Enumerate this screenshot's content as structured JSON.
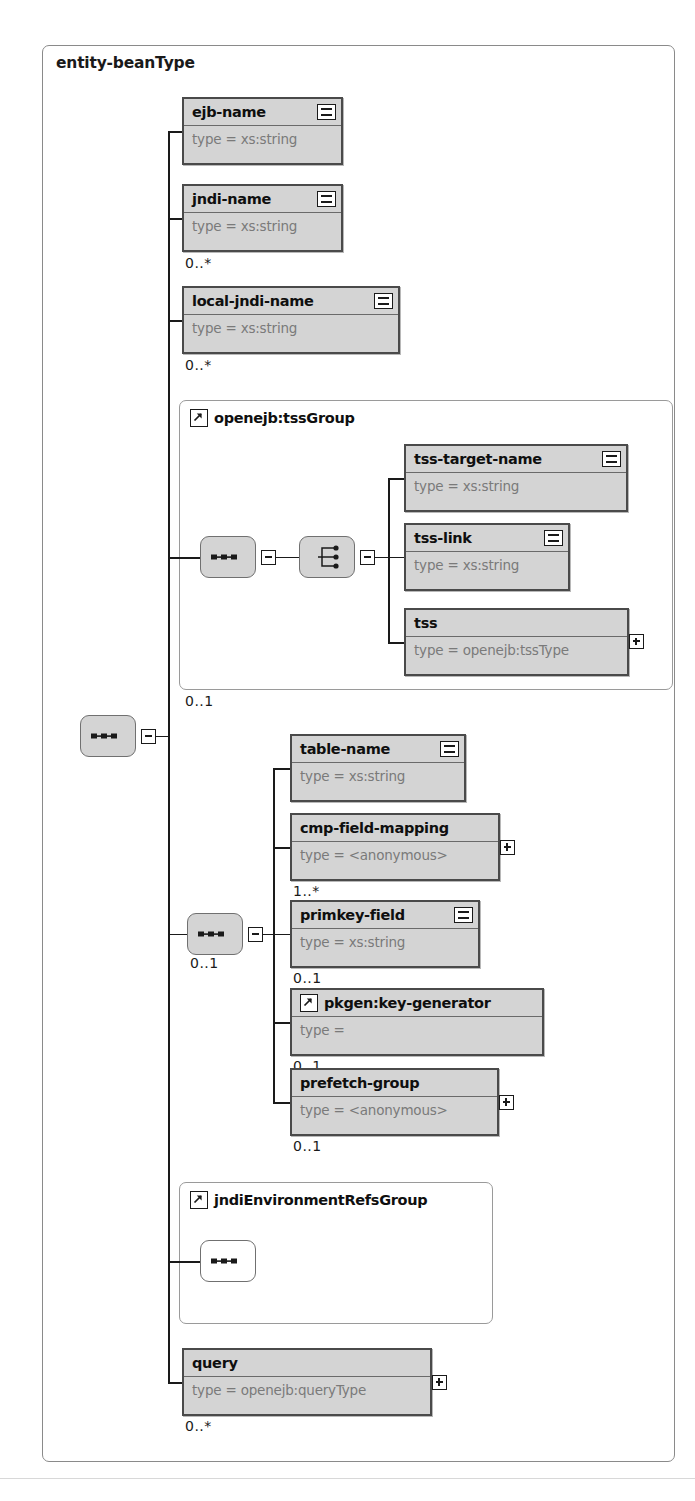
{
  "diagram": {
    "title": "entity-beanType",
    "kind": "xsd-complextype-diagram",
    "root_compositor": "sequence"
  },
  "elements": {
    "ejb_name": {
      "name": "ejb-name",
      "type": "type = xs:string",
      "attr_icon": "equals-icon"
    },
    "jndi_name": {
      "name": "jndi-name",
      "type": "type = xs:string",
      "attr_icon": "equals-icon",
      "cardinality": "0..*"
    },
    "local_jndi_name": {
      "name": "local-jndi-name",
      "type": "type = xs:string",
      "attr_icon": "equals-icon",
      "cardinality": "0..*"
    },
    "tss_target_name": {
      "name": "tss-target-name",
      "type": "type = xs:string",
      "attr_icon": "equals-icon"
    },
    "tss_link": {
      "name": "tss-link",
      "type": "type = xs:string",
      "attr_icon": "equals-icon"
    },
    "tss": {
      "name": "tss",
      "type": "type = openejb:tssType",
      "expander": "plus-icon"
    },
    "table_name": {
      "name": "table-name",
      "type": "type = xs:string",
      "attr_icon": "equals-icon"
    },
    "cmp_field_mapping": {
      "name": "cmp-field-mapping",
      "type": "type = <anonymous>",
      "expander": "plus-icon",
      "cardinality": "1..*"
    },
    "primkey_field": {
      "name": "primkey-field",
      "type": "type = xs:string",
      "attr_icon": "equals-icon",
      "cardinality": "0..1"
    },
    "key_generator": {
      "name": "pkgen:key-generator",
      "type": "type =",
      "ref_icon": "group-ref-arrow-icon",
      "cardinality": "0..1"
    },
    "prefetch_group": {
      "name": "prefetch-group",
      "type": "type = <anonymous>",
      "expander": "plus-icon",
      "cardinality": "0..1"
    },
    "query": {
      "name": "query",
      "type": "type = openejb:queryType",
      "expander": "plus-icon",
      "cardinality": "0..*"
    }
  },
  "groups": {
    "tss_group": {
      "label": "openejb:tssGroup",
      "ref_icon": "group-ref-arrow-icon",
      "cardinality": "0..1",
      "inner_compositor": "sequence",
      "choice_compositor": "choice"
    },
    "jndi_env_group": {
      "label": "jndiEnvironmentRefsGroup",
      "ref_icon": "group-ref-arrow-icon",
      "inner_compositor": "sequence"
    }
  },
  "compositors": {
    "root": {
      "kind": "sequence",
      "icon": "sequence-icon",
      "toggle": "minus-icon"
    },
    "tss_seq": {
      "kind": "sequence",
      "icon": "sequence-icon",
      "toggle": "minus-icon"
    },
    "tss_choice": {
      "kind": "choice",
      "icon": "choice-icon",
      "toggle": "minus-icon"
    },
    "cmp_seq": {
      "kind": "sequence",
      "icon": "sequence-icon",
      "toggle": "minus-icon",
      "cardinality": "0..1"
    },
    "jndi_seq": {
      "kind": "sequence",
      "icon": "sequence-icon"
    }
  },
  "colors": {
    "box_fill": "#d4d4d4",
    "box_border": "#4a4a4a",
    "type_text": "#7a7a7a",
    "name_text": "#0f0f0f",
    "container_border": "#8a8a8a",
    "line": "#1a1a1a"
  }
}
